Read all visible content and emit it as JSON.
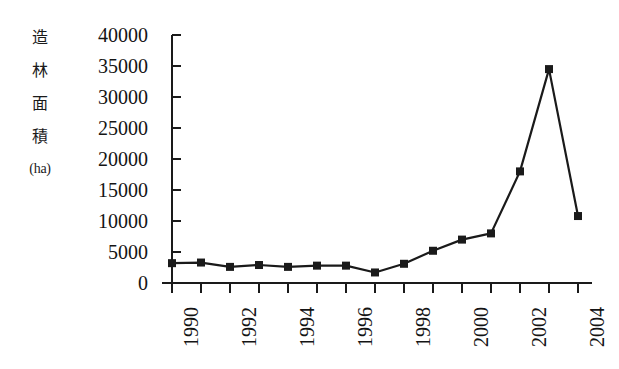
{
  "chart_data": {
    "type": "line",
    "title": "",
    "subtitle": "",
    "ylabel_chars": [
      "造",
      "林",
      "面",
      "積"
    ],
    "ylabel_unit": "(ha)",
    "ylabel": "造林面積 (ha)",
    "xlabel": "",
    "x": [
      1990,
      1991,
      1992,
      1993,
      1994,
      1995,
      1996,
      1997,
      1998,
      1999,
      2000,
      2001,
      2002,
      2003,
      2004
    ],
    "values": [
      3200,
      3300,
      2600,
      2900,
      2600,
      2800,
      2800,
      1700,
      3100,
      5200,
      7000,
      8000,
      18000,
      34500,
      10800
    ],
    "xtick_labels": [
      "1990",
      "1992",
      "1994",
      "1996",
      "1998",
      "2000",
      "2002",
      "2004"
    ],
    "xtick_label_years": [
      1990,
      1992,
      1994,
      1996,
      1998,
      2000,
      2002,
      2004
    ],
    "xtick_all_years": [
      1990,
      1991,
      1992,
      1993,
      1994,
      1995,
      1996,
      1997,
      1998,
      1999,
      2000,
      2001,
      2002,
      2003,
      2004
    ],
    "ytick_labels": [
      "40000",
      "35000",
      "30000",
      "25000",
      "20000",
      "15000",
      "10000",
      "5000",
      "0"
    ],
    "ytick_values": [
      40000,
      35000,
      30000,
      25000,
      20000,
      15000,
      10000,
      5000,
      0
    ],
    "ylim": [
      0,
      40000
    ],
    "xlim": [
      1990,
      2004
    ],
    "grid": false,
    "legend": null,
    "legend_position": "none",
    "marker": "square",
    "line_color": "#1a1a1a",
    "marker_color": "#1a1a1a",
    "axis_color": "#1a1a1a",
    "background_color": "#ffffff"
  }
}
